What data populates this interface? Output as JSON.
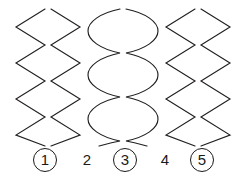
{
  "figure": {
    "background_color": "#ffffff",
    "stroke_color": "#231f20",
    "width": 244,
    "height": 176
  },
  "labels": [
    {
      "text": "1",
      "circled": true,
      "x": 33,
      "name": "label-1"
    },
    {
      "text": "2",
      "circled": false,
      "x": 75,
      "name": "label-2"
    },
    {
      "text": "3",
      "circled": true,
      "x": 113,
      "name": "label-3"
    },
    {
      "text": "4",
      "circled": false,
      "x": 153,
      "name": "label-4"
    },
    {
      "text": "5",
      "circled": true,
      "x": 190,
      "name": "label-5"
    }
  ],
  "waves": [
    {
      "id": "wave-1",
      "label": "1",
      "shape": "zigzag",
      "description": "Triangular zigzag wave, left member of pair 1-2",
      "path": "M 45,9 L 16,27 L 45,45 L 16,63 L 45,81 L 16,99 L 45,117 L 16,135 L 45,146"
    },
    {
      "id": "wave-2",
      "label": "2",
      "shape": "zigzag",
      "description": "Triangular zigzag wave, right member of pair 1-2, mirrored phase",
      "path": "M 51,9 L 80,27 L 51,45 L 80,63 L 51,81 L 80,99 L 51,117 L 80,135 L 51,146"
    },
    {
      "id": "wave-3-left",
      "label": "3",
      "shape": "sine",
      "description": "Smooth sinusoidal curve, left member of pair 3",
      "path": "M 120,9 C 100,13 88,22 88,31 C 88,40 100,49 120,53 C 100,57 88,66 88,75 C 88,84 100,93 120,97 C 100,101 88,110 88,119 C 88,128 100,137 120,141 C 110,143 103,145 99,146"
    },
    {
      "id": "wave-3-right",
      "label": "3",
      "shape": "sine",
      "description": "Smooth sinusoidal curve, right member of pair 3, mirrored phase",
      "path": "M 126,9 C 146,13 158,22 158,31 C 158,40 146,49 126,53 C 146,57 158,66 158,75 C 158,84 146,93 126,97 C 146,101 158,110 158,119 C 158,128 146,137 126,141 C 136,143 143,145 147,146"
    },
    {
      "id": "wave-4",
      "label": "4",
      "shape": "zigzag",
      "description": "Triangular zigzag wave, left member of pair 4-5",
      "path": "M 195,9 L 166,27 L 195,45 L 166,63 L 195,81 L 166,99 L 195,117 L 166,135 L 195,146"
    },
    {
      "id": "wave-5",
      "label": "5",
      "shape": "zigzag",
      "description": "Triangular zigzag wave, right member of pair 4-5, mirrored phase",
      "path": "M 201,9 L 230,27 L 201,45 L 230,63 L 201,81 L 230,99 L 201,117 L 230,135 L 201,146"
    }
  ]
}
